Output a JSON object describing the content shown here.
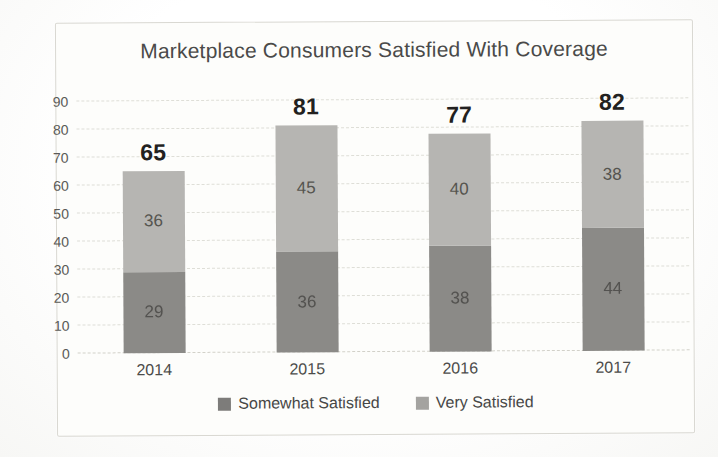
{
  "chart_data": {
    "type": "bar",
    "stacked": true,
    "title": "Marketplace Consumers Satisfied With Coverage",
    "categories": [
      "2014",
      "2015",
      "2016",
      "2017"
    ],
    "series": [
      {
        "name": "Somewhat Satisfied",
        "color": "#8b8a87",
        "values": [
          29,
          36,
          38,
          44
        ]
      },
      {
        "name": "Very Satisfied",
        "color": "#b6b5b2",
        "values": [
          36,
          45,
          40,
          38
        ]
      }
    ],
    "totals": [
      65,
      81,
      77,
      82
    ],
    "ylim": [
      0,
      90
    ],
    "yticks": [
      0,
      10,
      20,
      30,
      40,
      50,
      60,
      70,
      80,
      90
    ],
    "grid": true,
    "legend_position": "bottom",
    "legend_entries": [
      "Somewhat Satisfied",
      "Very Satisfied"
    ]
  }
}
